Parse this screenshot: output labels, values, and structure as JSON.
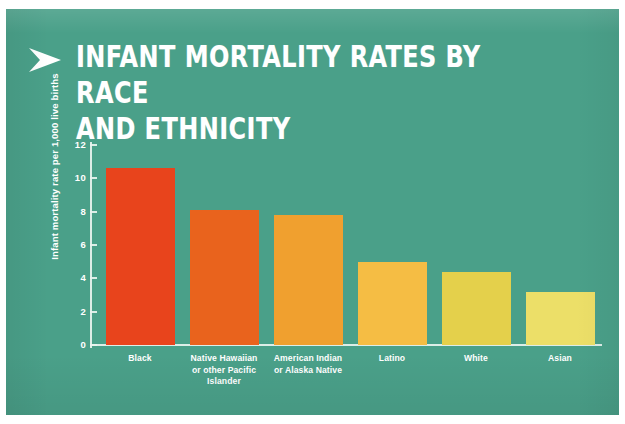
{
  "poster": {
    "background_color": "#4aa089",
    "title": "INFANT MORTALITY RATES BY RACE\nAND ETHNICITY",
    "arrow_icon": "arrow-right-icon"
  },
  "chart_data": {
    "type": "bar",
    "title": "INFANT MORTALITY RATES BY RACE AND ETHNICITY",
    "xlabel": "",
    "ylabel": "Infant mortality rate per 1,000 live births",
    "ylim": [
      0,
      12
    ],
    "ytick_labels": [
      "12",
      "10",
      "8",
      "6",
      "4",
      "2",
      "0"
    ],
    "yticks": [
      12,
      10,
      8,
      6,
      4,
      2,
      0
    ],
    "grid": false,
    "legend": "none",
    "categories": [
      "Black",
      "Native Hawaiian or other Pacific Islander",
      "American Indian or Alaska Native",
      "Latino",
      "White",
      "Asian"
    ],
    "category_lines": [
      [
        "Black"
      ],
      [
        "Native Hawaiian",
        "or other Pacific",
        "Islander"
      ],
      [
        "American Indian",
        "or Alaska Native"
      ],
      [
        "Latino"
      ],
      [
        "White"
      ],
      [
        "Asian"
      ]
    ],
    "values": [
      10.6,
      8.1,
      7.8,
      5.0,
      4.4,
      3.2
    ],
    "bar_colors": [
      "#e8441c",
      "#e9631d",
      "#f0a02f",
      "#f5bd44",
      "#e4d04b",
      "#ecdf68"
    ]
  }
}
